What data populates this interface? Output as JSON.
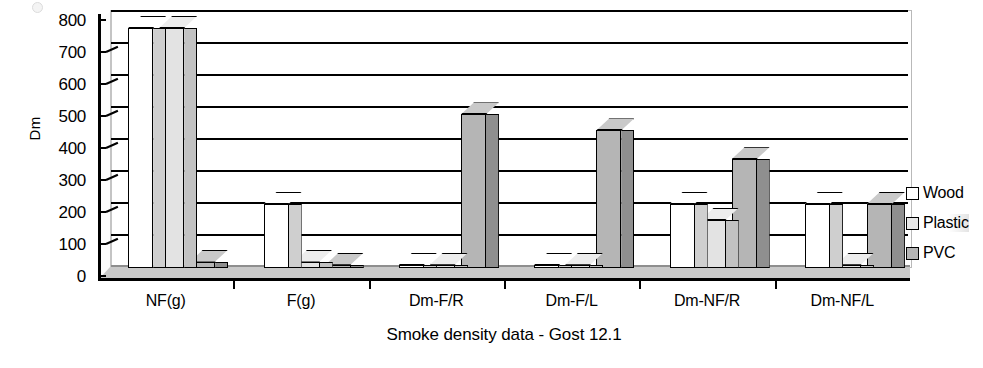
{
  "chart_data": {
    "type": "bar",
    "title": "",
    "xlabel": "Smoke density data - Gost 12.1",
    "ylabel": "Dm",
    "categories": [
      "NF(g)",
      "F(g)",
      "Dm-F/R",
      "Dm-F/L",
      "Dm-NF/R",
      "Dm-NF/L"
    ],
    "series": [
      {
        "name": "Wood",
        "values": [
          750,
          200,
          5,
          5,
          200,
          200
        ],
        "color": "#ffffff"
      },
      {
        "name": "Plastic",
        "values": [
          750,
          20,
          10,
          10,
          150,
          10
        ],
        "color": "#e8e8e8"
      },
      {
        "name": "PVC",
        "values": [
          20,
          10,
          480,
          430,
          340,
          200
        ],
        "color": "#b5b5b5"
      }
    ],
    "ylim": [
      0,
      800
    ],
    "ytick_step": 100,
    "yticks": [
      "800",
      "700",
      "600",
      "500",
      "400",
      "300",
      "200",
      "100",
      "0"
    ],
    "grid": true,
    "legend_position": "right",
    "style": "3d-column"
  },
  "legend": {
    "items": [
      {
        "label": "Wood"
      },
      {
        "label": "Plastic"
      },
      {
        "label": "PVC"
      }
    ]
  }
}
